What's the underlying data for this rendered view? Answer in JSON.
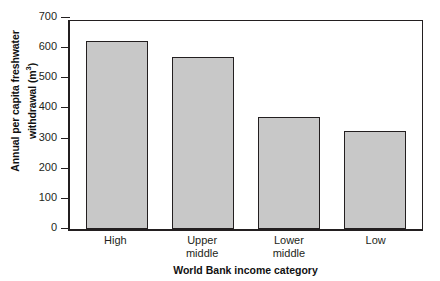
{
  "chart_data": {
    "type": "bar",
    "title": "",
    "categories": [
      "High",
      "Upper middle",
      "Lower middle",
      "Low"
    ],
    "category_lines": [
      [
        "High",
        ""
      ],
      [
        "Upper",
        "middle"
      ],
      [
        "Lower",
        "middle"
      ],
      [
        "Low",
        ""
      ]
    ],
    "values": [
      625,
      570,
      370,
      325
    ],
    "xlabel": "World Bank income category",
    "ylabel_line1": "Annual per capita freshwater",
    "ylabel_line2_prefix": "withdrawal (m",
    "ylabel_line2_sup": "3",
    "ylabel_line2_suffix": ")",
    "ylim": [
      0,
      700
    ],
    "ytick_values": [
      700,
      600,
      500,
      400,
      300,
      200,
      100,
      0
    ],
    "ytick_labels": [
      "700",
      "600",
      "500",
      "400",
      "300",
      "200",
      "100",
      "0"
    ],
    "grid": false,
    "legend": null,
    "bar_fill_color": "#c8c8c8",
    "bar_edge_color": "#231f20",
    "axis_color": "#231f20",
    "background_color": "#ffffff"
  }
}
